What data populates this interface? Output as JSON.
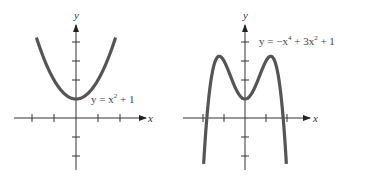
{
  "chart_data": [
    {
      "type": "line",
      "title": "",
      "equation": "y = x^2 + 1",
      "label": {
        "pre": "y = x",
        "sup": "2",
        "post": " + 1"
      },
      "xlabel": "x",
      "ylabel": "y",
      "xlim": [
        -2.2,
        2.2
      ],
      "ylim": [
        -2.5,
        4.5
      ],
      "x_ticks": [
        -2,
        -1,
        1,
        2
      ],
      "y_ticks": [
        -2,
        -1,
        1,
        2,
        3,
        4
      ],
      "grid": false,
      "x": [
        -1.8,
        -1.5,
        -1,
        -0.5,
        0,
        0.5,
        1,
        1.5,
        1.8
      ],
      "values": [
        4.24,
        3.25,
        2,
        1.25,
        1,
        1.25,
        2,
        3.25,
        4.24
      ],
      "curve_color": "#555555"
    },
    {
      "type": "line",
      "title": "",
      "equation": "y = -x^4 + 3x^2 + 1",
      "label": {
        "pre": "y = −x",
        "sup1": "4",
        "mid": " + 3x",
        "sup2": "2",
        "post": " + 1"
      },
      "xlabel": "x",
      "ylabel": "y",
      "xlim": [
        -2.3,
        2.3
      ],
      "ylim": [
        -3,
        4.5
      ],
      "x_ticks": [
        -2,
        -1,
        1,
        2
      ],
      "y_ticks": [
        -2,
        -1,
        1,
        2,
        3,
        4
      ],
      "grid": false,
      "x": [
        -1.97,
        -1.5,
        -1.22,
        -1,
        -0.5,
        0,
        0.5,
        1,
        1.22,
        1.5,
        1.97
      ],
      "values": [
        -2.42,
        2.69,
        3.25,
        3,
        1.69,
        1,
        1.69,
        3,
        3.25,
        2.69,
        -2.42
      ],
      "local_maxima": [
        [
          -1.22,
          3.25
        ],
        [
          1.22,
          3.25
        ]
      ],
      "local_minimum": [
        0,
        1
      ],
      "curve_color": "#555555"
    }
  ],
  "axes": {
    "x_label": "x",
    "y_label": "y"
  }
}
